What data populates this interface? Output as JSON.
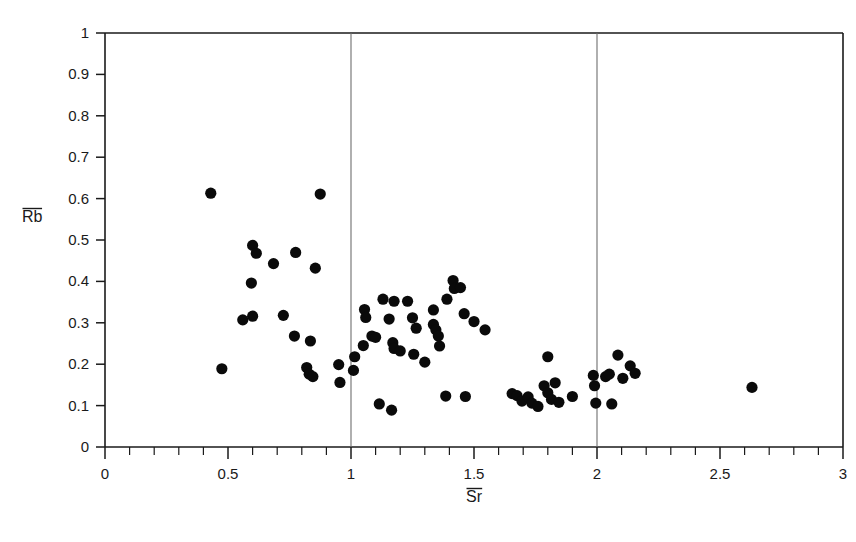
{
  "figure": {
    "caption": "",
    "background_color": "#ffffff",
    "point_color": "#0a0a0a",
    "axis_color": "#1a1a1a",
    "reference_line_color": "#6e6e6e"
  },
  "axis_titles": {
    "x": "Sr",
    "y": "Rb",
    "x_has_overbar": true,
    "y_has_overbar": true
  },
  "chart_data": {
    "type": "scatter",
    "title": "",
    "xlabel": "Sr",
    "ylabel": "Rb",
    "xlim": [
      0,
      3
    ],
    "ylim": [
      0,
      1
    ],
    "grid": false,
    "legend": false,
    "xticks": [
      0,
      0.5,
      1,
      1.5,
      2,
      2.5,
      3
    ],
    "xtick_labels": [
      "0",
      "0.5",
      "1",
      "1.5",
      "2",
      "2.5",
      "3"
    ],
    "x_minor_tick_step": 0.1,
    "yticks": [
      0,
      0.1,
      0.2,
      0.3,
      0.4,
      0.5,
      0.6,
      0.7,
      0.8,
      0.9,
      1
    ],
    "ytick_labels": [
      "0",
      "0.1",
      "0.2",
      "0.3",
      "0.4",
      "0.5",
      "0.6",
      "0.7",
      "0.8",
      "0.9",
      "1"
    ],
    "reference_lines_x": [
      1,
      2
    ],
    "marker": "filled-circle",
    "marker_size_px": 7,
    "n_points": 73,
    "points": [
      [
        0.43,
        0.613
      ],
      [
        0.875,
        0.611
      ],
      [
        0.6,
        0.487
      ],
      [
        0.615,
        0.468
      ],
      [
        0.775,
        0.47
      ],
      [
        0.685,
        0.443
      ],
      [
        0.855,
        0.432
      ],
      [
        0.595,
        0.396
      ],
      [
        0.56,
        0.307
      ],
      [
        0.6,
        0.316
      ],
      [
        0.725,
        0.318
      ],
      [
        0.77,
        0.268
      ],
      [
        0.835,
        0.256
      ],
      [
        0.82,
        0.192
      ],
      [
        0.83,
        0.176
      ],
      [
        0.845,
        0.17
      ],
      [
        0.475,
        0.189
      ],
      [
        0.95,
        0.199
      ],
      [
        0.955,
        0.156
      ],
      [
        1.055,
        0.332
      ],
      [
        1.06,
        0.313
      ],
      [
        1.13,
        0.357
      ],
      [
        1.175,
        0.352
      ],
      [
        1.155,
        0.309
      ],
      [
        1.23,
        0.352
      ],
      [
        1.25,
        0.312
      ],
      [
        1.265,
        0.287
      ],
      [
        1.335,
        0.331
      ],
      [
        1.39,
        0.357
      ],
      [
        1.415,
        0.402
      ],
      [
        1.42,
        0.383
      ],
      [
        1.445,
        0.385
      ],
      [
        1.46,
        0.322
      ],
      [
        1.5,
        0.303
      ],
      [
        1.545,
        0.283
      ],
      [
        1.085,
        0.268
      ],
      [
        1.1,
        0.265
      ],
      [
        1.17,
        0.252
      ],
      [
        1.175,
        0.238
      ],
      [
        1.335,
        0.296
      ],
      [
        1.345,
        0.283
      ],
      [
        1.355,
        0.268
      ],
      [
        1.36,
        0.244
      ],
      [
        1.2,
        0.232
      ],
      [
        1.255,
        0.224
      ],
      [
        1.05,
        0.245
      ],
      [
        1.015,
        0.218
      ],
      [
        1.01,
        0.185
      ],
      [
        1.3,
        0.205
      ],
      [
        1.385,
        0.123
      ],
      [
        1.465,
        0.122
      ],
      [
        1.115,
        0.104
      ],
      [
        1.165,
        0.089
      ],
      [
        1.655,
        0.129
      ],
      [
        1.675,
        0.124
      ],
      [
        1.695,
        0.111
      ],
      [
        1.72,
        0.121
      ],
      [
        1.735,
        0.106
      ],
      [
        1.76,
        0.098
      ],
      [
        1.785,
        0.148
      ],
      [
        1.8,
        0.131
      ],
      [
        1.815,
        0.115
      ],
      [
        1.83,
        0.155
      ],
      [
        1.845,
        0.108
      ],
      [
        1.8,
        0.218
      ],
      [
        1.9,
        0.122
      ],
      [
        1.985,
        0.173
      ],
      [
        1.99,
        0.148
      ],
      [
        1.995,
        0.106
      ],
      [
        2.035,
        0.17
      ],
      [
        2.05,
        0.176
      ],
      [
        2.06,
        0.104
      ],
      [
        2.085,
        0.222
      ],
      [
        2.105,
        0.166
      ],
      [
        2.135,
        0.196
      ],
      [
        2.155,
        0.178
      ],
      [
        2.63,
        0.144
      ]
    ]
  },
  "plot_geometry": {
    "left_px": 105,
    "right_px": 843,
    "top_px": 33,
    "bottom_px": 447
  }
}
